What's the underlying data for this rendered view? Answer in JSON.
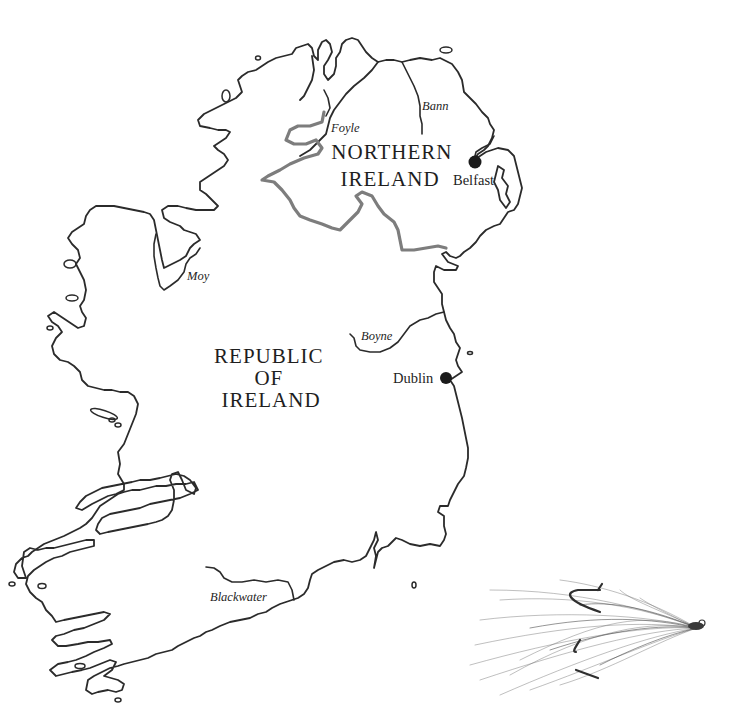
{
  "map": {
    "title": "Ireland rivers map",
    "regions": [
      {
        "id": "northern-ireland",
        "lines": [
          "NORTHERN",
          "IRELAND"
        ]
      },
      {
        "id": "republic-of-ireland",
        "lines": [
          "REPUBLIC",
          "OF",
          "IRELAND"
        ]
      }
    ],
    "cities": [
      {
        "name": "Belfast"
      },
      {
        "name": "Dublin"
      }
    ],
    "rivers": [
      {
        "name": "Foyle"
      },
      {
        "name": "Bann"
      },
      {
        "name": "Moy"
      },
      {
        "name": "Boyne"
      },
      {
        "name": "Blackwater"
      }
    ],
    "colors": {
      "coastline": "#2b2b2b",
      "border": "#7d7d7d",
      "city_marker": "#1b1b1b",
      "background": "#ffffff"
    }
  },
  "illustration": {
    "subject": "salmon-fly-drawing"
  }
}
